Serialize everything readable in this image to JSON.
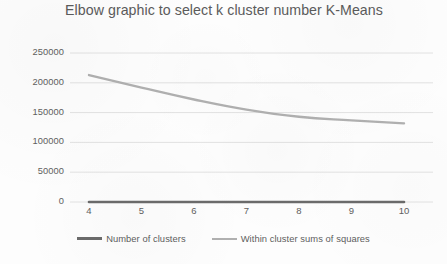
{
  "chart_data": {
    "type": "line",
    "title": "Elbow graphic to select k cluster number K-Means",
    "xlabel": "",
    "ylabel": "",
    "x": [
      4,
      5,
      6,
      7,
      8,
      9,
      10
    ],
    "categories": [
      "4",
      "5",
      "6",
      "7",
      "8",
      "9",
      "10"
    ],
    "series": [
      {
        "name": "Number of clusters",
        "values": [
          0,
          0,
          0,
          0,
          0,
          0,
          0
        ],
        "color": "#6b6b6b"
      },
      {
        "name": "Within cluster sums of squares",
        "values": [
          213000,
          192000,
          172000,
          155000,
          143000,
          137000,
          132000
        ],
        "color": "#b0b0b0"
      }
    ],
    "ylim": [
      0,
      250000
    ],
    "ytick_labels": [
      "0",
      "50000",
      "100000",
      "150000",
      "200000",
      "250000"
    ],
    "ytick_values": [
      0,
      50000,
      100000,
      150000,
      200000,
      250000
    ],
    "xtick_labels": [
      "4",
      "5",
      "6",
      "7",
      "8",
      "9",
      "10"
    ],
    "grid": true,
    "legend_position": "bottom"
  },
  "colors": {
    "grid": "#e2e2e2",
    "title_text": "#5b5b5b",
    "tick_text": "#606060",
    "series_clusters": "#6b6b6b",
    "series_wcss": "#b0b0b0",
    "background": "#fdfdfd"
  }
}
